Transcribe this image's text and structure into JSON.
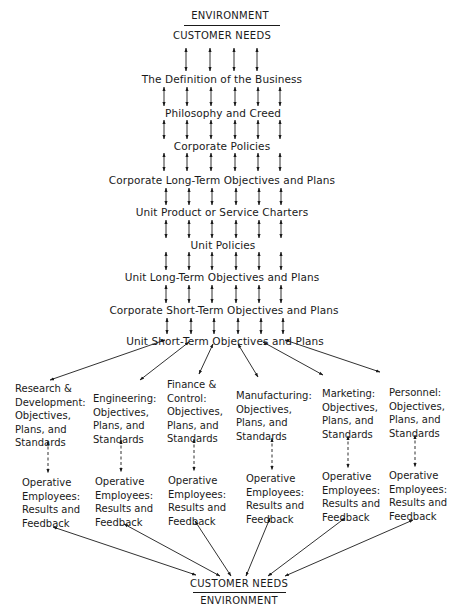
{
  "top": {
    "environment": "ENVIRONMENT",
    "customer_needs": "CUSTOMER NEEDS"
  },
  "levels": [
    "The Definition of the Business",
    "Philosophy and Creed",
    "Corporate Policies",
    "Corporate Long-Term Objectives and Plans",
    "Unit Product or Service Charters",
    "Unit Policies",
    "Unit Long-Term Objectives and Plans",
    "Corporate Short-Term Objectives and Plans",
    "Unit Short-Term Objectives and Plans"
  ],
  "departments": [
    {
      "lines": [
        "Research &",
        "Development:",
        "Objectives,",
        "Plans, and",
        "Standards"
      ]
    },
    {
      "lines": [
        "Engineering:",
        "Objectives,",
        "Plans, and",
        "Standards"
      ]
    },
    {
      "lines": [
        "Finance &",
        "Control:",
        "Objectives,",
        "Plans, and",
        "Standards"
      ]
    },
    {
      "lines": [
        "Manufacturing:",
        "Objectives,",
        "Plans, and",
        "Standards"
      ]
    },
    {
      "lines": [
        "Marketing:",
        "Objectives,",
        "Plans, and",
        "Standards"
      ]
    },
    {
      "lines": [
        "Personnel:",
        "Objectives,",
        "Plans, and",
        "Standards"
      ]
    }
  ],
  "operative": {
    "lines": [
      "Operative",
      "Employees:",
      "Results and",
      "Feedback"
    ]
  },
  "bottom": {
    "customer_needs": "CUSTOMER NEEDS",
    "environment": "ENVIRONMENT"
  }
}
